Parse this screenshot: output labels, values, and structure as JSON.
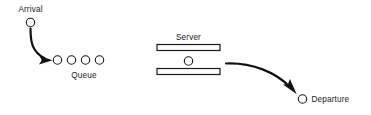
{
  "diagram": {
    "type": "queueing-system-flow",
    "title": "",
    "background_color": "#ffffff",
    "stroke_color": "#111111",
    "node_fill_color": "#ffffff",
    "labels": {
      "arrival": "Arrival",
      "queue": "Queue",
      "server": "Server",
      "departure": "Departure"
    },
    "nodes": {
      "arrival_entity": {
        "shape": "circle",
        "cx": 30.5,
        "cy": 22.5,
        "r": 4.2
      },
      "server_entity": {
        "shape": "circle",
        "cx": 188.5,
        "cy": 61.0,
        "r": 4.2
      },
      "departure_entity": {
        "shape": "circle",
        "cx": 302.5,
        "cy": 99.0,
        "r": 4.2
      }
    },
    "queue_entities": {
      "count": 4,
      "radius": 4.2,
      "cy": 60.0,
      "cx_values": [
        57.5,
        71.5,
        85.5,
        99.5
      ]
    },
    "server_bars": [
      {
        "name": "top-bar",
        "x": 157,
        "y": 44.5,
        "width": 63,
        "height": 6
      },
      {
        "name": "bottom-bar",
        "x": 157,
        "y": 68.5,
        "width": 63,
        "height": 6
      }
    ],
    "flows": [
      {
        "name": "arrival-to-queue",
        "path": "M 30.5 28.5 C 30.5 42 32 52 45 58.5",
        "arrow_points": "52.5,60.2 39.5,56.0 41.8,60.2 39.0,64.5"
      },
      {
        "name": "server-to-departure",
        "path": "M 226 63.5 C 252 62.5 276 72 291 88",
        "arrow_points": "296.5,94.0 283.0,84.5 288.0,84.0 290.0,79.0"
      }
    ],
    "label_positions": {
      "arrival": {
        "x": 30.5,
        "y": 11.5
      },
      "queue": {
        "x": 84.0,
        "y": 77.5
      },
      "server": {
        "x": 188.5,
        "y": 40.0
      },
      "departure": {
        "x": 311.5,
        "y": 102.0
      }
    }
  }
}
